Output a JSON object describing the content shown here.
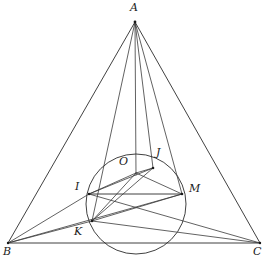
{
  "figure": {
    "type": "geometry-diagram",
    "width": 269,
    "height": 263,
    "background_color": "#ffffff",
    "stroke_color": "#2b2b2b"
  },
  "points": {
    "A": {
      "label": "A",
      "x": 135,
      "y": 22,
      "label_x": 130,
      "label_y": 2
    },
    "B": {
      "label": "B",
      "x": 8,
      "y": 243,
      "label_x": 3,
      "label_y": 246
    },
    "C": {
      "label": "C",
      "x": 260,
      "y": 243,
      "label_x": 254,
      "label_y": 246
    },
    "O": {
      "label": "O",
      "x": 136,
      "y": 167,
      "label_x": 120,
      "label_y": 157
    },
    "J": {
      "label": "J",
      "x": 153,
      "y": 168,
      "label_x": 156,
      "label_y": 148
    },
    "I": {
      "label": "I",
      "x": 89,
      "y": 194,
      "label_x": 75,
      "label_y": 182
    },
    "M": {
      "label": "M",
      "x": 182,
      "y": 194,
      "label_x": 189,
      "label_y": 184
    },
    "K": {
      "label": "K",
      "x": 92,
      "y": 221,
      "label_x": 74,
      "label_y": 227
    }
  },
  "circle": {
    "name": "incircle",
    "center_x": 136,
    "center_y": 204,
    "radius": 50
  },
  "segments": [
    {
      "name": "side-AB",
      "from": "A",
      "to": "B"
    },
    {
      "name": "side-AC",
      "from": "A",
      "to": "C"
    },
    {
      "name": "side-BC",
      "from": "B",
      "to": "C"
    },
    {
      "name": "cevian-A-O",
      "from": "A",
      "to": "O"
    },
    {
      "name": "cevian-A-J",
      "from": "A",
      "to": "J"
    },
    {
      "name": "cevian-A-M",
      "from": "A",
      "to": "M"
    },
    {
      "name": "cevian-A-I-K",
      "from": "A",
      "to": "K"
    },
    {
      "name": "chord-I-M",
      "from": "I",
      "to": "M"
    },
    {
      "name": "chord-I-J",
      "from": "I",
      "to": "J"
    },
    {
      "name": "chord-J-K",
      "from": "J",
      "to": "K"
    },
    {
      "name": "chord-K-M",
      "from": "K",
      "to": "M"
    },
    {
      "name": "radius-O-J",
      "from": "O",
      "to": "J"
    },
    {
      "name": "radius-O-I",
      "from": "O",
      "to": "I"
    },
    {
      "name": "radius-O-K",
      "from": "O",
      "to": "K"
    },
    {
      "name": "radius-O-M",
      "from": "O",
      "to": "M"
    },
    {
      "name": "line-B-I",
      "from": "B",
      "to": "I"
    },
    {
      "name": "line-B-K",
      "from": "B",
      "to": "K"
    },
    {
      "name": "line-B-M",
      "from": "B",
      "to": "M"
    },
    {
      "name": "line-C-I",
      "from": "C",
      "to": "I"
    },
    {
      "name": "line-C-K",
      "from": "C",
      "to": "K"
    },
    {
      "name": "line-C-M",
      "from": "C",
      "to": "M"
    }
  ]
}
